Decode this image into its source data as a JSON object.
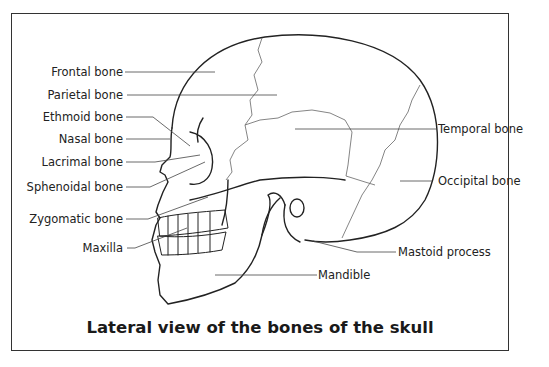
{
  "diagram": {
    "caption": "Lateral view of the bones of the skull",
    "labels_left": [
      {
        "id": "frontal",
        "text": "Frontal bone"
      },
      {
        "id": "parietal",
        "text": "Parietal bone"
      },
      {
        "id": "ethmoid",
        "text": "Ethmoid bone"
      },
      {
        "id": "nasal",
        "text": "Nasal bone"
      },
      {
        "id": "lacrimal",
        "text": "Lacrimal bone"
      },
      {
        "id": "sphenoidal",
        "text": "Sphenoidal bone"
      },
      {
        "id": "zygomatic",
        "text": "Zygomatic bone"
      },
      {
        "id": "maxilla",
        "text": "Maxilla"
      }
    ],
    "labels_right": [
      {
        "id": "temporal",
        "text": "Temporal bone"
      },
      {
        "id": "occipital",
        "text": "Occipital bone"
      },
      {
        "id": "mastoid",
        "text": "Mastoid process"
      },
      {
        "id": "mandible",
        "text": "Mandible"
      }
    ],
    "colors": {
      "line": "#222222",
      "suture": "#555555",
      "frame": "#333333"
    }
  }
}
